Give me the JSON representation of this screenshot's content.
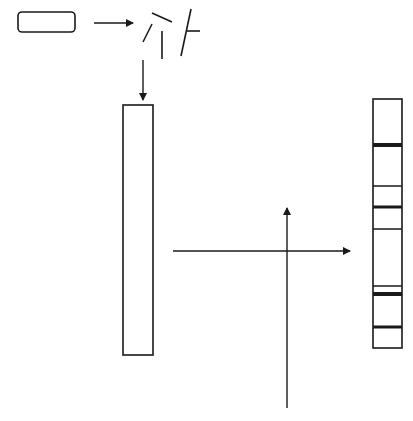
{
  "diagram": {
    "width": 413,
    "height": 421,
    "background": "#ffffff",
    "stroke_color": "#1a1a1a",
    "nodes": [
      {
        "id": "sample-block",
        "shape": "rounded-rect",
        "x": 18,
        "y": 12,
        "w": 57,
        "h": 20,
        "rx": 4
      },
      {
        "id": "empty-lane",
        "shape": "rect",
        "x": 123,
        "y": 105,
        "w": 30,
        "h": 250
      },
      {
        "id": "banded-lane",
        "shape": "rect",
        "x": 373,
        "y": 99,
        "w": 29,
        "h": 249
      }
    ],
    "fragments": [
      {
        "x1": 152,
        "y1": 13,
        "x2": 172,
        "y2": 22
      },
      {
        "x1": 152,
        "y1": 24,
        "x2": 143,
        "y2": 42
      },
      {
        "x1": 162,
        "y1": 31,
        "x2": 162,
        "y2": 59
      },
      {
        "x1": 191,
        "y1": 9,
        "x2": 181,
        "y2": 56
      },
      {
        "x1": 187,
        "y1": 31,
        "x2": 200,
        "y2": 31
      }
    ],
    "arrows": [
      {
        "id": "arrow-sample-to-fragments",
        "x1": 94,
        "y1": 23,
        "x2": 133,
        "y2": 23
      },
      {
        "id": "arrow-fragments-to-lane",
        "x1": 143,
        "y1": 60,
        "x2": 143,
        "y2": 100
      },
      {
        "id": "arrow-lane-to-bands",
        "x1": 173,
        "y1": 251,
        "x2": 350,
        "y2": 251
      },
      {
        "id": "arrow-vertical-up",
        "x1": 287,
        "y1": 408,
        "x2": 287,
        "y2": 208
      }
    ],
    "bands": [
      {
        "y": 145,
        "thickness": 4
      },
      {
        "y": 186,
        "thickness": 1.5
      },
      {
        "y": 207,
        "thickness": 3
      },
      {
        "y": 229,
        "thickness": 1.5
      },
      {
        "y": 286,
        "thickness": 1.5
      },
      {
        "y": 294,
        "thickness": 4
      },
      {
        "y": 327,
        "thickness": 3
      }
    ]
  }
}
